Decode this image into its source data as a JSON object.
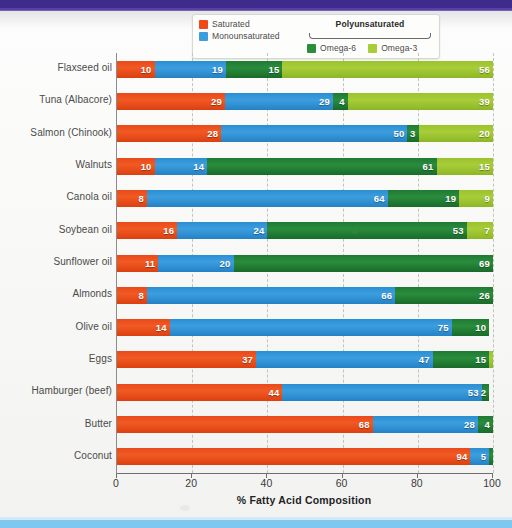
{
  "decor": {
    "top_band_color": "#3f2b8c",
    "bottom_band_color": "#7ec8ef"
  },
  "legend": {
    "saturated_label": "Saturated",
    "monounsaturated_label": "Monounsaturated",
    "group_title": "Polyunsaturated",
    "omega6_label": "Omega-6",
    "omega3_label": "Omega-3",
    "colors": {
      "saturated": "#ef4a18",
      "monounsaturated": "#3d9ede",
      "omega6": "#2b8c3c",
      "omega3": "#a8cd3a"
    }
  },
  "chart_data": {
    "type": "bar",
    "orientation": "horizontal",
    "stacked": true,
    "title": "",
    "xlabel": "% Fatty Acid Composition",
    "ylabel": "",
    "xlim": [
      0,
      100
    ],
    "xticks": [
      0,
      20,
      40,
      60,
      80,
      100
    ],
    "grid": "vertical-dashed",
    "legend_position": "top",
    "categories": [
      "Flaxseed oil",
      "Tuna (Albacore)",
      "Salmon (Chinook)",
      "Walnuts",
      "Canola oil",
      "Soybean oil",
      "Sunflower oil",
      "Almonds",
      "Olive oil",
      "Eggs",
      "Hamburger (beef)",
      "Butter",
      "Coconut"
    ],
    "series": [
      {
        "name": "Saturated",
        "color": "#ef4a18",
        "values": [
          10,
          29,
          28,
          10,
          8,
          16,
          11,
          8,
          14,
          37,
          44,
          68,
          94
        ]
      },
      {
        "name": "Monounsaturated",
        "color": "#3d9ede",
        "values": [
          19,
          29,
          50,
          14,
          64,
          24,
          20,
          66,
          75,
          47,
          53,
          28,
          5
        ]
      },
      {
        "name": "Omega-6",
        "color": "#2b8c3c",
        "values": [
          15,
          4,
          3,
          61,
          19,
          53,
          69,
          26,
          10,
          15,
          2,
          4,
          1
        ]
      },
      {
        "name": "Omega-3",
        "color": "#a8cd3a",
        "values": [
          56,
          39,
          20,
          15,
          9,
          7,
          0,
          0,
          0,
          1,
          0,
          0,
          0
        ]
      }
    ],
    "bar_labels": {
      "Flaxseed oil": [
        "10",
        "19",
        "15",
        "56"
      ],
      "Tuna (Albacore)": [
        "29",
        "29",
        "4",
        "39"
      ],
      "Salmon (Chinook)": [
        "28",
        "50",
        "3",
        "20"
      ],
      "Walnuts": [
        "10",
        "14",
        "61",
        "15"
      ],
      "Canola oil": [
        "8",
        "64",
        "19",
        "9"
      ],
      "Soybean oil": [
        "16",
        "24",
        "53",
        "7"
      ],
      "Sunflower oil": [
        "11",
        "20",
        "69",
        ""
      ],
      "Almonds": [
        "8",
        "66",
        "26",
        ""
      ],
      "Olive oil": [
        "14",
        "75",
        "10",
        ""
      ],
      "Eggs": [
        "37",
        "47",
        "15",
        ""
      ],
      "Hamburger (beef)": [
        "44",
        "53",
        "2",
        ""
      ],
      "Butter": [
        "68",
        "28",
        "4",
        ""
      ],
      "Coconut": [
        "94",
        "5",
        "",
        ""
      ]
    }
  }
}
